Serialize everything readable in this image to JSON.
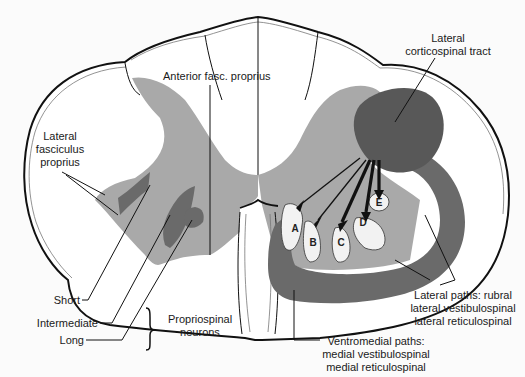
{
  "diagram": {
    "labels": {
      "anterior_fasc_proprius": "Anterior fasc. proprius",
      "lateral_corticospinal": [
        "Lateral",
        "corticospinal tract"
      ],
      "lateral_fasciculus_proprius": [
        "Lateral",
        "fasciculus",
        "proprius"
      ],
      "short": "Short",
      "intermediate": "Intermediate",
      "long": "Long",
      "propriospinal_neurons": [
        "Propriospinal",
        "neurons"
      ],
      "lateral_paths": [
        "Lateral paths: rubral",
        "lateral vestibulospinal",
        "lateral reticulospinal"
      ],
      "ventromedial_paths": [
        "Ventromedial paths:",
        "medial vestibulospinal",
        "medial reticulospinal"
      ]
    },
    "motor_pools": [
      "A",
      "B",
      "C",
      "D",
      "E"
    ],
    "colors": {
      "gray_matter": "#a9a9a9",
      "tract_dark": "#6a6a6a",
      "outline": "#111111",
      "background": "#fbfbfb"
    }
  }
}
